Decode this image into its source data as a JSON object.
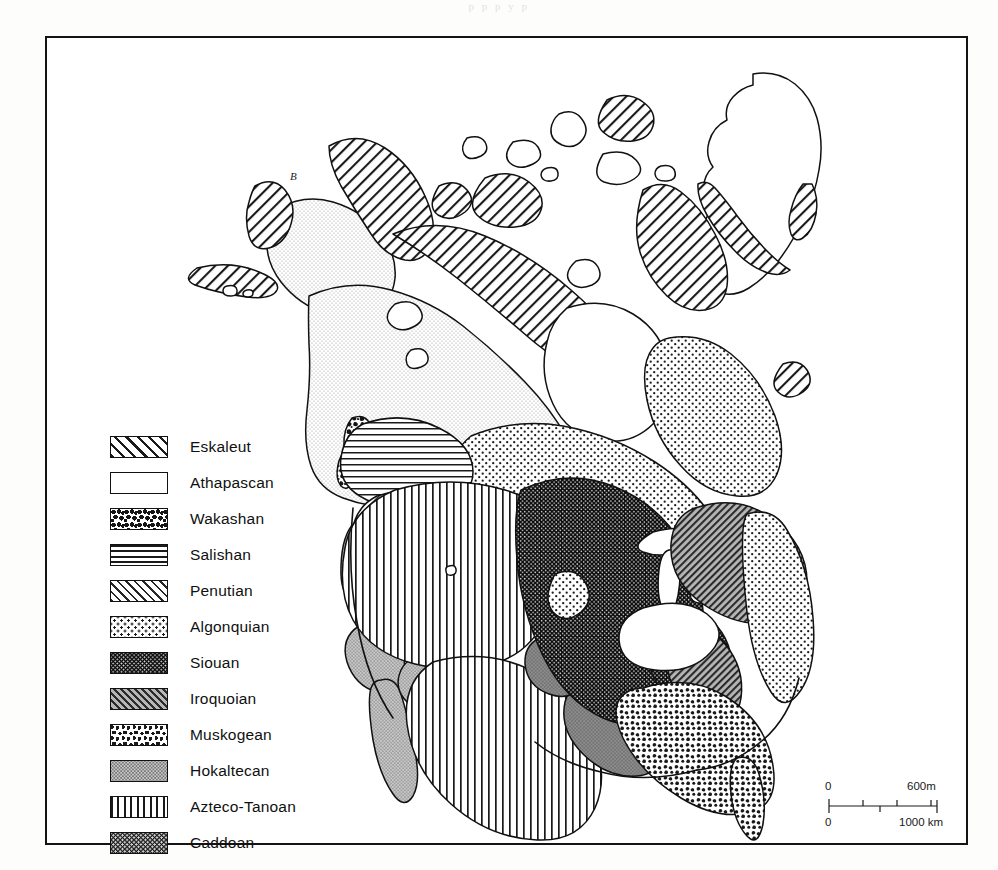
{
  "page": {
    "bleed_text": "p   p   p   y   p",
    "background": "#ffffff",
    "ink_color": "#111111"
  },
  "map": {
    "title": "NORTH AMERICAN LANGUAGE GROUPS",
    "region_annotation": "B",
    "frame": {
      "stroke": "#141414"
    }
  },
  "legend": {
    "items": [
      {
        "label": "Eskaleut",
        "pattern": "diagonal-hatch-right",
        "swatch_name": "legend-swatch-eskaleut"
      },
      {
        "label": "Athapascan",
        "pattern": "fine-stipple-light",
        "swatch_name": "legend-swatch-athapascan"
      },
      {
        "label": "Wakashan",
        "pattern": "mottled-blotch",
        "swatch_name": "legend-swatch-wakashan"
      },
      {
        "label": "Salishan",
        "pattern": "horizontal-lines",
        "swatch_name": "legend-swatch-salishan"
      },
      {
        "label": "Penutian",
        "pattern": "diagonal-hatch-fine",
        "swatch_name": "legend-swatch-penutian"
      },
      {
        "label": "Algonquian",
        "pattern": "sparse-dots",
        "swatch_name": "legend-swatch-algonquian"
      },
      {
        "label": "Siouan",
        "pattern": "dense-dark-dots",
        "swatch_name": "legend-swatch-siouan"
      },
      {
        "label": "Iroquoian",
        "pattern": "diagonal-hatch-gray",
        "swatch_name": "legend-swatch-iroquoian"
      },
      {
        "label": "Muskogean",
        "pattern": "coarse-stipple",
        "swatch_name": "legend-swatch-muskogean"
      },
      {
        "label": "Hokaltecan",
        "pattern": "mid-gray-stipple",
        "swatch_name": "legend-swatch-hokaltecan"
      },
      {
        "label": "Azteco-Tanoan",
        "pattern": "vertical-lines",
        "swatch_name": "legend-swatch-azteco-tanoan"
      },
      {
        "label": "Caddoan",
        "pattern": "dark-checker-dots",
        "swatch_name": "legend-swatch-caddoan"
      }
    ]
  },
  "scale_bar": {
    "miles_zero": "0",
    "miles_max": "600m",
    "km_zero": "0",
    "km_max": "1000 km"
  }
}
